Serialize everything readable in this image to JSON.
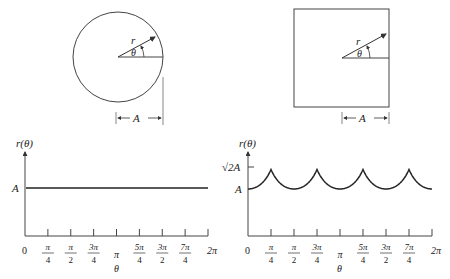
{
  "diagrams": {
    "circle": {
      "r_label": "r",
      "theta_label": "θ",
      "dim_label": "A"
    },
    "square": {
      "r_label": "r",
      "theta_label": "θ",
      "dim_label": "A"
    }
  },
  "charts": {
    "left": {
      "ylabel": "r(θ)",
      "xlabel": "θ",
      "y_ticks": [
        "A"
      ],
      "origin_label": "0"
    },
    "right": {
      "ylabel": "r(θ)",
      "xlabel": "θ",
      "y_ticks": [
        "√2A",
        "A"
      ],
      "origin_label": "0"
    },
    "x_ticks": [
      {
        "num": "π",
        "den": "4"
      },
      {
        "num": "π",
        "den": "2"
      },
      {
        "num": "3π",
        "den": "4"
      },
      {
        "num": "π",
        "den": ""
      },
      {
        "num": "5π",
        "den": "4"
      },
      {
        "num": "3π",
        "den": "2"
      },
      {
        "num": "7π",
        "den": "4"
      },
      {
        "num": "2π",
        "den": ""
      }
    ]
  },
  "chart_data": [
    {
      "type": "line",
      "title": "Circle: r(θ) = A",
      "xlabel": "θ",
      "ylabel": "r(θ)",
      "x": [
        "0",
        "π/4",
        "π/2",
        "3π/4",
        "π",
        "5π/4",
        "3π/2",
        "7π/4",
        "2π"
      ],
      "series": [
        {
          "name": "r(θ)",
          "values": [
            1,
            1,
            1,
            1,
            1,
            1,
            1,
            1,
            1
          ]
        }
      ],
      "y_tick_labels": [
        "A"
      ],
      "ylim": [
        0,
        1.5
      ],
      "xlim": [
        0,
        6.2832
      ]
    },
    {
      "type": "line",
      "title": "Square: r(θ) = A / max(|cos θ|, |sin θ|)",
      "xlabel": "θ",
      "ylabel": "r(θ)",
      "x": [
        "0",
        "π/4",
        "π/2",
        "3π/4",
        "π",
        "5π/4",
        "3π/2",
        "7π/4",
        "2π"
      ],
      "series": [
        {
          "name": "r(θ)",
          "values": [
            1,
            1.414,
            1,
            1.414,
            1,
            1.414,
            1,
            1.414,
            1
          ]
        }
      ],
      "y_tick_labels": [
        "A",
        "√2A"
      ],
      "ylim": [
        0,
        1.5
      ],
      "xlim": [
        0,
        6.2832
      ]
    }
  ]
}
